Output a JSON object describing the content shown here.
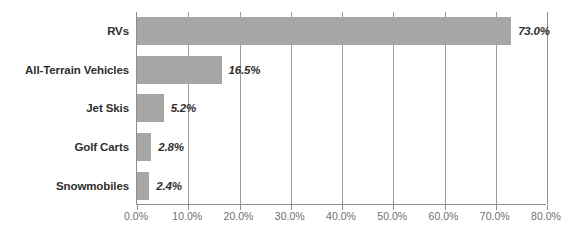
{
  "chart_data": {
    "type": "bar",
    "orientation": "horizontal",
    "title": "",
    "xlabel": "",
    "ylabel": "",
    "categories": [
      "RVs",
      "All-Terrain Vehicles",
      "Jet Skis",
      "Golf Carts",
      "Snowmobiles"
    ],
    "values": [
      73.0,
      16.5,
      5.2,
      2.8,
      2.4
    ],
    "value_labels": [
      "73.0%",
      "16.5%",
      "5.2%",
      "2.8%",
      "2.4%"
    ],
    "xlim": [
      0,
      80
    ],
    "xticks": [
      0,
      10,
      20,
      30,
      40,
      50,
      60,
      70,
      80
    ],
    "xtick_labels": [
      "0.0%",
      "10.0%",
      "20.0%",
      "30.0%",
      "40.0%",
      "50.0%",
      "60.0%",
      "70.0%",
      "80.0%"
    ],
    "grid": "vertical",
    "legend": "none",
    "bar_color": "#a6a6a6",
    "gridline_color": "#9a9a9a",
    "axis_color": "#8d8d8d",
    "label_color": "#2f2f2f",
    "tick_label_color": "#6f6f6f"
  },
  "axis": {
    "tick_labels": [
      "0.0%",
      "10.0%",
      "20.0%",
      "30.0%",
      "40.0%",
      "50.0%",
      "60.0%",
      "70.0%",
      "80.0%"
    ]
  },
  "bars": [
    {
      "category": "RVs",
      "value": 73.0,
      "label": "73.0%"
    },
    {
      "category": "All-Terrain Vehicles",
      "value": 16.5,
      "label": "16.5%"
    },
    {
      "category": "Jet Skis",
      "value": 5.2,
      "label": "5.2%"
    },
    {
      "category": "Golf Carts",
      "value": 2.8,
      "label": "2.8%"
    },
    {
      "category": "Snowmobiles",
      "value": 2.4,
      "label": "2.4%"
    }
  ]
}
